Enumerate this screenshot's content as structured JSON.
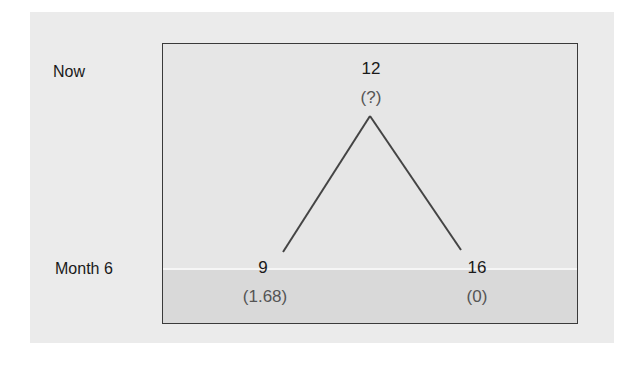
{
  "diagram": {
    "rows": [
      {
        "label": "Now"
      },
      {
        "label": "Month 6"
      }
    ],
    "root": {
      "value": "12",
      "sub": "(?)"
    },
    "leaves": [
      {
        "value": "9",
        "sub": "(1.68)"
      },
      {
        "value": "16",
        "sub": "(0)"
      }
    ],
    "colors": {
      "panel": "#ebebeb",
      "box_border": "#3a3a3a",
      "edge": "#444444"
    }
  }
}
